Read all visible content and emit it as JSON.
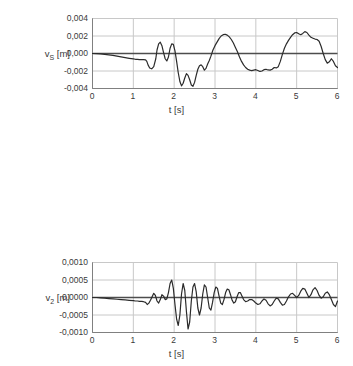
{
  "figure": {
    "decimal_separator": ",",
    "line_color": "#2b2b2b",
    "grid_color": "#c8c8c8",
    "axis_color": "#808080",
    "zero_line_color": "#4d4d4d",
    "background": "#ffffff"
  },
  "chart_data": [
    {
      "type": "line",
      "title": "",
      "ylabel": "v_S [m]",
      "ylabel_base": "v",
      "ylabel_sub": "S",
      "ylabel_unit": "[m]",
      "xlabel": "t [s]",
      "xlim": [
        0,
        6
      ],
      "ylim": [
        -0.004,
        0.004
      ],
      "xticks": [
        0,
        1,
        2,
        3,
        4,
        5,
        6
      ],
      "xticklabels": [
        "0",
        "1",
        "2",
        "3",
        "4",
        "5",
        "6"
      ],
      "yticks": [
        0.004,
        0.002,
        0.0,
        -0.002,
        -0.004
      ],
      "yticklabels": [
        "0,004",
        "0,002",
        "0,000",
        "-0,002",
        "-0,004"
      ],
      "grid": true,
      "legend": null,
      "series": [
        {
          "name": "v_S",
          "x": [
            0.0,
            0.1,
            0.2,
            0.3,
            0.4,
            0.5,
            0.6,
            0.7,
            0.8,
            0.9,
            1.0,
            1.05,
            1.1,
            1.15,
            1.2,
            1.25,
            1.3,
            1.33,
            1.36,
            1.4,
            1.45,
            1.5,
            1.55,
            1.58,
            1.62,
            1.66,
            1.7,
            1.74,
            1.78,
            1.82,
            1.86,
            1.9,
            1.94,
            1.98,
            2.02,
            2.06,
            2.1,
            2.14,
            2.18,
            2.22,
            2.26,
            2.3,
            2.34,
            2.38,
            2.42,
            2.46,
            2.5,
            2.54,
            2.58,
            2.62,
            2.66,
            2.7,
            2.74,
            2.78,
            2.82,
            2.86,
            2.9,
            2.95,
            3.0,
            3.05,
            3.1,
            3.15,
            3.2,
            3.25,
            3.3,
            3.35,
            3.4,
            3.45,
            3.5,
            3.55,
            3.6,
            3.65,
            3.7,
            3.75,
            3.8,
            3.85,
            3.9,
            3.95,
            4.0,
            4.05,
            4.1,
            4.15,
            4.2,
            4.25,
            4.3,
            4.35,
            4.4,
            4.45,
            4.5,
            4.55,
            4.6,
            4.65,
            4.7,
            4.75,
            4.8,
            4.85,
            4.9,
            4.95,
            5.0,
            5.05,
            5.1,
            5.15,
            5.2,
            5.25,
            5.3,
            5.35,
            5.4,
            5.45,
            5.5,
            5.55,
            5.6,
            5.65,
            5.7,
            5.75,
            5.8,
            5.85,
            5.9,
            5.95,
            6.0
          ],
          "y": [
            0.0,
            -2e-05,
            -5e-05,
            -0.0001,
            -0.00016,
            -0.00022,
            -0.0003,
            -0.00038,
            -0.00047,
            -0.00055,
            -0.00062,
            -0.00066,
            -0.00068,
            -0.0007,
            -0.0007,
            -0.0007,
            -0.00072,
            -0.0009,
            -0.0013,
            -0.00165,
            -0.00175,
            -0.0015,
            -0.0006,
            0.0004,
            0.0011,
            0.0013,
            0.0009,
            0.0001,
            -0.0006,
            -0.00085,
            -0.0004,
            0.0006,
            0.0011,
            0.00105,
            0.0003,
            -0.0009,
            -0.0022,
            -0.0032,
            -0.0037,
            -0.0034,
            -0.0028,
            -0.0023,
            -0.0025,
            -0.003,
            -0.0036,
            -0.00375,
            -0.0033,
            -0.0025,
            -0.0018,
            -0.0014,
            -0.0013,
            -0.0015,
            -0.0019,
            -0.0017,
            -0.0012,
            -0.0008,
            -0.0003,
            0.0004,
            0.0009,
            0.0013,
            0.0017,
            0.002,
            0.00215,
            0.0022,
            0.0021,
            0.0019,
            0.0016,
            0.0012,
            0.0007,
            0.0002,
            -0.0004,
            -0.0009,
            -0.0013,
            -0.0016,
            -0.0018,
            -0.0019,
            -0.00195,
            -0.0019,
            -0.00185,
            -0.00195,
            -0.00205,
            -0.002,
            -0.00185,
            -0.0018,
            -0.00188,
            -0.0019,
            -0.0018,
            -0.0016,
            -0.00165,
            -0.0015,
            -0.0009,
            -0.0001,
            0.0006,
            0.0011,
            0.0015,
            0.00185,
            0.00215,
            0.00235,
            0.0024,
            0.00225,
            0.00215,
            0.0023,
            0.0025,
            0.0024,
            0.0021,
            0.00185,
            0.00175,
            0.00165,
            0.0016,
            0.0014,
            0.0008,
            0.0,
            -0.0007,
            -0.0011,
            -0.00095,
            -0.0006,
            -0.0009,
            -0.0014,
            -0.0016
          ]
        }
      ]
    },
    {
      "type": "line",
      "title": "",
      "ylabel": "v_2 [m]",
      "ylabel_base": "v",
      "ylabel_sub": "2",
      "ylabel_unit": "[m]",
      "xlabel": "t [s]",
      "xlim": [
        0,
        6
      ],
      "ylim": [
        -0.001,
        0.001
      ],
      "xticks": [
        0,
        1,
        2,
        3,
        4,
        5,
        6
      ],
      "xticklabels": [
        "0",
        "1",
        "2",
        "3",
        "4",
        "5",
        "6"
      ],
      "yticks": [
        0.001,
        0.0005,
        0.0,
        -0.0005,
        -0.001
      ],
      "yticklabels": [
        "0,0010",
        "0,0005",
        "0,0000",
        "-0,0005",
        "-0,0010"
      ],
      "grid": true,
      "legend": null,
      "series": [
        {
          "name": "v_2",
          "x": [
            0.0,
            0.1,
            0.2,
            0.3,
            0.4,
            0.5,
            0.6,
            0.7,
            0.8,
            0.9,
            1.0,
            1.05,
            1.1,
            1.15,
            1.2,
            1.25,
            1.3,
            1.34,
            1.38,
            1.42,
            1.46,
            1.5,
            1.54,
            1.58,
            1.62,
            1.66,
            1.7,
            1.74,
            1.78,
            1.82,
            1.86,
            1.9,
            1.94,
            1.98,
            2.02,
            2.06,
            2.1,
            2.14,
            2.18,
            2.22,
            2.26,
            2.3,
            2.34,
            2.38,
            2.42,
            2.46,
            2.5,
            2.54,
            2.58,
            2.62,
            2.66,
            2.7,
            2.74,
            2.78,
            2.82,
            2.86,
            2.9,
            2.94,
            2.98,
            3.02,
            3.06,
            3.1,
            3.14,
            3.18,
            3.22,
            3.26,
            3.3,
            3.34,
            3.38,
            3.42,
            3.46,
            3.5,
            3.54,
            3.58,
            3.62,
            3.66,
            3.7,
            3.75,
            3.8,
            3.85,
            3.9,
            3.95,
            4.0,
            4.05,
            4.1,
            4.15,
            4.2,
            4.25,
            4.3,
            4.35,
            4.4,
            4.45,
            4.5,
            4.55,
            4.6,
            4.65,
            4.7,
            4.75,
            4.8,
            4.85,
            4.9,
            4.95,
            5.0,
            5.05,
            5.1,
            5.15,
            5.2,
            5.25,
            5.3,
            5.35,
            5.4,
            5.45,
            5.5,
            5.55,
            5.6,
            5.65,
            5.7,
            5.75,
            5.8,
            5.85,
            5.9,
            5.95,
            6.0
          ],
          "y": [
            0.0,
            0.0,
            -1e-05,
            -2e-05,
            -3e-05,
            -4e-05,
            -5e-05,
            -6e-05,
            -7e-05,
            -8e-05,
            -9e-05,
            -0.0001,
            -0.0001,
            -0.00011,
            -0.00011,
            -0.00012,
            -0.00014,
            -0.0002,
            -0.00016,
            -8e-05,
            2e-05,
            0.00012,
            6e-05,
            -0.0001,
            -0.00016,
            -6e-05,
            8e-05,
            4e-05,
            -6e-05,
            -4e-05,
            0.00014,
            0.0004,
            0.0005,
            0.00026,
            -0.0002,
            -0.00062,
            -0.0008,
            -0.0005,
            0.0001,
            0.0004,
            0.0002,
            -0.0004,
            -0.0009,
            -0.0007,
            -0.0001,
            0.0003,
            0.0004,
            0.00016,
            -0.0003,
            -0.0005,
            -0.0003,
            0.0001,
            0.00036,
            0.0003,
            0.0,
            -0.0003,
            -0.00036,
            -0.00014,
            0.00014,
            0.0003,
            0.00026,
            4e-05,
            -0.00016,
            -0.0002,
            -6e-05,
            0.00014,
            0.00024,
            0.00022,
            8e-05,
            -8e-05,
            -0.00016,
            -0.00012,
            2e-05,
            0.00014,
            0.00014,
            4e-05,
            -6e-05,
            -0.00012,
            -0.0001,
            -6e-05,
            -6e-05,
            -0.0001,
            -0.00016,
            -0.0002,
            -0.00018,
            -0.0001,
            -4e-05,
            -8e-05,
            -0.00018,
            -0.00024,
            -0.0002,
            -0.0001,
            -2e-05,
            -4e-05,
            -0.00014,
            -0.00022,
            -0.0002,
            -0.0001,
            2e-05,
            0.0001,
            0.00012,
            6e-05,
            0.0,
            6e-05,
            0.00018,
            0.00026,
            0.00024,
            0.00012,
            0.0,
            8e-05,
            0.00022,
            0.00028,
            0.0002,
            6e-05,
            -2e-05,
            2e-05,
            0.00012,
            0.00016,
            8e-05,
            -6e-05,
            -0.0002,
            -0.00026,
            -0.0001
          ]
        }
      ]
    },
    {
      "type": "line",
      "title": "",
      "ylabel": "φ_2",
      "ylabel_base": "φ",
      "ylabel_sub": "2",
      "ylabel_unit": "",
      "xlabel": "t [s]",
      "xlim": [
        0,
        6
      ],
      "ylim": [
        -0.0001,
        0.0001
      ],
      "xticks": [
        0,
        1,
        2,
        3,
        4,
        5,
        6
      ],
      "xticklabels": [
        "0",
        "1",
        "2",
        "3",
        "4",
        "5",
        "6"
      ],
      "yticks": [
        0.0001,
        5e-05,
        0.0,
        -5e-05,
        -0.0001
      ],
      "yticklabels": [
        "0,00010",
        "0,00005",
        "0,00000",
        "-0,00005",
        "-0,00010"
      ],
      "grid": true,
      "legend": null,
      "series": [
        {
          "name": "phi_2",
          "x": [
            0.0,
            0.1,
            0.2,
            0.3,
            0.4,
            0.5,
            0.6,
            0.7,
            0.8,
            0.9,
            1.0,
            1.05,
            1.1,
            1.15,
            1.2,
            1.25,
            1.3,
            1.34,
            1.38,
            1.42,
            1.46,
            1.5,
            1.54,
            1.58,
            1.62,
            1.66,
            1.7,
            1.74,
            1.78,
            1.82,
            1.86,
            1.9,
            1.94,
            1.98,
            2.02,
            2.06,
            2.1,
            2.14,
            2.18,
            2.22,
            2.26,
            2.3,
            2.34,
            2.38,
            2.42,
            2.46,
            2.5,
            2.54,
            2.58,
            2.62,
            2.66,
            2.7,
            2.74,
            2.78,
            2.82,
            2.86,
            2.9,
            2.94,
            2.98,
            3.02,
            3.06,
            3.1,
            3.14,
            3.18,
            3.22,
            3.26,
            3.3,
            3.34,
            3.38,
            3.42,
            3.46,
            3.5,
            3.54,
            3.58,
            3.62,
            3.66,
            3.7,
            3.75,
            3.8,
            3.85,
            3.9,
            3.95,
            4.0,
            4.05,
            4.1,
            4.15,
            4.2,
            4.25,
            4.3,
            4.35,
            4.4,
            4.45,
            4.5,
            4.55,
            4.6,
            4.65,
            4.7,
            4.75,
            4.8,
            4.85,
            4.9,
            4.95,
            5.0,
            5.05,
            5.1,
            5.15,
            5.2,
            5.25,
            5.3,
            5.35,
            5.4,
            5.45,
            5.5,
            5.55,
            5.6,
            5.65,
            5.7,
            5.75,
            5.8,
            5.85,
            5.9,
            5.95,
            6.0
          ],
          "y": [
            0.0,
            0.0,
            -1e-06,
            -2e-06,
            -3e-06,
            -4e-06,
            -5e-06,
            -6e-06,
            -7e-06,
            -8e-06,
            -9e-06,
            -1e-05,
            -1e-05,
            -1.1e-05,
            -1.1e-05,
            -1.2e-05,
            -1.4e-05,
            -2e-05,
            -1.6e-05,
            -8e-06,
            2e-06,
            1.2e-05,
            6e-06,
            -1e-05,
            -1.6e-05,
            -6e-06,
            1e-05,
            6e-06,
            -6e-06,
            -4e-06,
            1.4e-05,
            3.2e-05,
            3.5e-05,
            1.4e-05,
            -2.8e-05,
            -5.2e-05,
            -5.8e-05,
            -3.4e-05,
            6e-06,
            2.4e-05,
            1.2e-05,
            -3e-05,
            -6.6e-05,
            -7.2e-05,
            -4e-05,
            0.0,
            2e-05,
            1.8e-05,
            -1e-05,
            -3.4e-05,
            -3e-05,
            -6e-06,
            1.8e-05,
            2.4e-05,
            8e-06,
            -1.6e-05,
            -2.6e-05,
            -1.2e-05,
            1e-05,
            2.2e-05,
            2e-05,
            6e-06,
            -1e-05,
            -1.6e-05,
            -6e-06,
            1.2e-05,
            2.2e-05,
            2e-05,
            1e-05,
            0.0,
            -6e-06,
            -4e-06,
            4e-06,
            1e-05,
            8e-06,
            0.0,
            -8e-06,
            -1.2e-05,
            -1e-05,
            -6e-06,
            -6e-06,
            -1.2e-05,
            -1.8e-05,
            -2.2e-05,
            -1.8e-05,
            -1e-05,
            -6e-06,
            -1.2e-05,
            -2e-05,
            -2.4e-05,
            -1.8e-05,
            -8e-06,
            -4e-06,
            -8e-06,
            -1.8e-05,
            -2.2e-05,
            -1.6e-05,
            -6e-06,
            4e-06,
            1.2e-05,
            1.2e-05,
            6e-06,
            0.0,
            8e-06,
            2e-05,
            2.8e-05,
            2.4e-05,
            1.2e-05,
            2e-06,
            1e-05,
            2.4e-05,
            2.8e-05,
            1.8e-05,
            6e-06,
            0.0,
            6e-06,
            1.4e-05,
            1.4e-05,
            4e-06,
            -8e-06,
            -1.8e-05,
            -2e-05,
            -8e-06
          ]
        }
      ]
    }
  ]
}
